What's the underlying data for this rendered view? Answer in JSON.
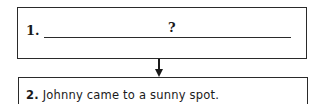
{
  "diagram": {
    "type": "flowchart",
    "steps": [
      {
        "number": "1.",
        "text": "",
        "blank_prompt": "?"
      },
      {
        "number": "2.",
        "text": "Johnny came to a sunny spot."
      }
    ],
    "connectors": [
      {
        "from": 0,
        "to": 1,
        "direction": "down"
      }
    ],
    "colors": {
      "stroke": "#2a2a2a",
      "text": "#1a1a1a",
      "background": "#ffffff"
    }
  }
}
